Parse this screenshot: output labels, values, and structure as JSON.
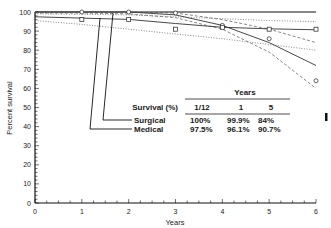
{
  "chart_data": {
    "type": "line",
    "title": "",
    "xlabel": "Years",
    "ylabel": "Percent survival",
    "xlim": [
      0,
      6
    ],
    "ylim": [
      0,
      100
    ],
    "x_ticks": [
      "0",
      "1",
      "2",
      "3",
      "4",
      "5",
      "6"
    ],
    "y_ticks": [
      "0",
      "10",
      "20",
      "30",
      "40",
      "50",
      "60",
      "70",
      "80",
      "90",
      "100"
    ],
    "grid": false,
    "series": [
      {
        "name": "Surgical",
        "marker": "circle",
        "observed": {
          "x": [
            1,
            2,
            3,
            4,
            5,
            6
          ],
          "y": [
            100,
            100,
            99.5,
            93,
            86,
            64
          ]
        },
        "fitted": {
          "x": [
            0,
            1,
            2,
            3,
            4,
            5,
            6
          ],
          "y": [
            100,
            100,
            100,
            98.5,
            93,
            84,
            72
          ]
        },
        "ci_lower": {
          "x": [
            0,
            1,
            2,
            3,
            4,
            5,
            6
          ],
          "y": [
            99.5,
            99.5,
            99,
            97,
            91,
            79,
            60
          ]
        },
        "ci_upper": {
          "x": [
            0,
            1,
            2,
            3,
            4,
            5,
            6
          ],
          "y": [
            100,
            100,
            100,
            99.5,
            96,
            91,
            84
          ]
        }
      },
      {
        "name": "Medical",
        "marker": "square",
        "observed": {
          "x": [
            1,
            2,
            3,
            4,
            5,
            6
          ],
          "y": [
            96,
            96,
            91,
            92,
            91,
            91
          ]
        },
        "fitted": {
          "x": [
            0,
            1,
            2,
            3,
            4,
            5,
            6
          ],
          "y": [
            97.5,
            96.8,
            96.1,
            94,
            92,
            91.2,
            90.7
          ]
        },
        "ci_lower": {
          "x": [
            0,
            1,
            2,
            3,
            4,
            5,
            6
          ],
          "y": [
            95.5,
            93.5,
            91,
            88.5,
            86,
            83,
            80
          ]
        },
        "ci_upper": {
          "x": [
            0,
            1,
            2,
            3,
            4,
            5,
            6
          ],
          "y": [
            99,
            98.8,
            98.5,
            97.5,
            96.5,
            95.5,
            95
          ]
        }
      }
    ],
    "inset_table": {
      "header_group": "Years",
      "row_header": "Survival (%)",
      "columns": [
        "1/12",
        "1",
        "5"
      ],
      "rows": [
        {
          "label": "Surgical",
          "values": [
            "100%",
            "99.9%",
            "84%"
          ]
        },
        {
          "label": "Medical",
          "values": [
            "97.5%",
            "96.1%",
            "90.7%"
          ]
        }
      ]
    }
  }
}
